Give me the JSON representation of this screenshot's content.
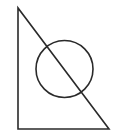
{
  "diagram": {
    "stroke_color": "#2a2a2a",
    "background": "#ffffff",
    "triangle": {
      "vertices": [
        [
          18,
          8
        ],
        [
          18,
          129
        ],
        [
          109,
          129
        ]
      ]
    },
    "circle": {
      "cx": 64.5,
      "cy": 69,
      "r": 28.5
    }
  }
}
